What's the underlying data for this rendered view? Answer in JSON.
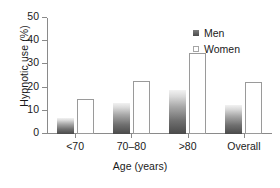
{
  "chart_data": {
    "type": "bar",
    "title": "",
    "xlabel": "Age (years)",
    "ylabel": "Hypnotic use (%)",
    "categories": [
      "<70",
      "70–80",
      ">80",
      "Overall"
    ],
    "series": [
      {
        "name": "Men",
        "values": [
          7,
          13.5,
          19,
          12.5
        ],
        "color": "#5a5a5a",
        "fill": "gradient-dark-to-light"
      },
      {
        "name": "Women",
        "values": [
          15,
          23,
          35,
          22.5
        ],
        "color": "#ffffff",
        "fill": "outline"
      }
    ],
    "ylim": [
      0,
      50
    ],
    "yticks": [
      0,
      10,
      20,
      30,
      40,
      50
    ],
    "ytick_labels": [
      "0",
      "10",
      "20",
      "30",
      "40",
      "50"
    ],
    "grid": false,
    "legend_position": "top-right"
  },
  "legend": {
    "items": [
      {
        "label": "Men",
        "swatch": "men-swatch"
      },
      {
        "label": "Women",
        "swatch": "women-swatch"
      }
    ]
  },
  "axes": {
    "y_title": "Hypnotic use (%)",
    "x_title": "Age (years)"
  }
}
